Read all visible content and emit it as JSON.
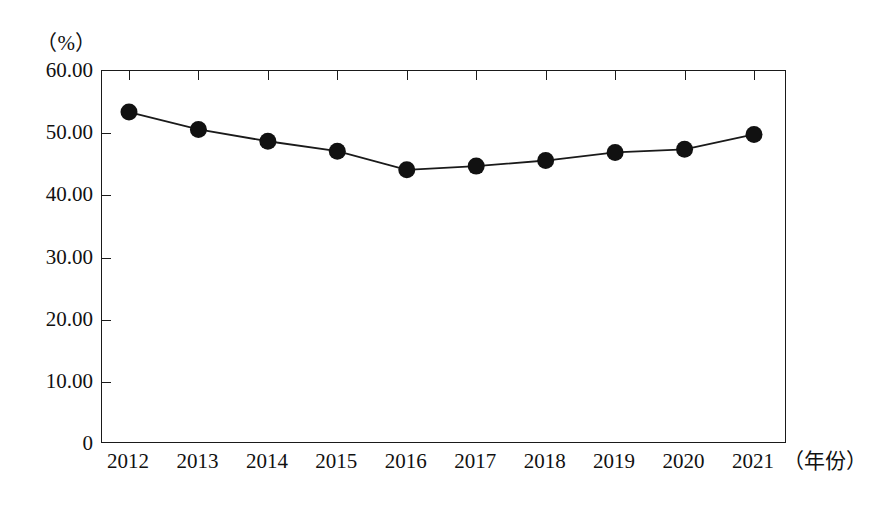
{
  "chart_data": {
    "type": "line",
    "title": "",
    "subtitle": "",
    "xlabel": "（年份）",
    "ylabel": "（%）",
    "categories": [
      "2012",
      "2013",
      "2014",
      "2015",
      "2016",
      "2017",
      "2018",
      "2019",
      "2020",
      "2021"
    ],
    "values": [
      53.4,
      50.6,
      48.7,
      47.1,
      44.1,
      44.7,
      45.6,
      46.9,
      47.4,
      49.8
    ],
    "series": [
      {
        "name": "",
        "values": [
          53.4,
          50.6,
          48.7,
          47.1,
          44.1,
          44.7,
          45.6,
          46.9,
          47.4,
          49.8
        ]
      }
    ],
    "ylim": [
      0,
      60
    ],
    "xlim": [
      "2012",
      "2021"
    ],
    "ytick_values": [
      0,
      10,
      20,
      30,
      40,
      50,
      60
    ],
    "ytick_labels": [
      "0",
      "10.00",
      "20.00",
      "30.00",
      "40.00",
      "50.00",
      "60.00"
    ],
    "xtick_labels": [
      "2012",
      "2013",
      "2014",
      "2015",
      "2016",
      "2017",
      "2018",
      "2019",
      "2020",
      "2021"
    ],
    "grid": false,
    "legend": false,
    "legend_position": "none",
    "marker": "filled-circle",
    "line_color": "#1a1a1a",
    "marker_color": "#111111",
    "background_color": "#ffffff",
    "frame": true,
    "annotations": []
  },
  "axes": {
    "y_unit_label": "（%）",
    "x_unit_label": "（年份）"
  }
}
